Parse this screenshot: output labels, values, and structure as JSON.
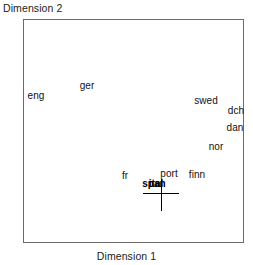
{
  "chart_data": {
    "type": "scatter",
    "title": "",
    "xlabel": "Dimension 1",
    "ylabel": "Dimension 2",
    "grid": false,
    "legend": "none",
    "axis_ticks": [],
    "xlim": [
      0,
      1
    ],
    "ylim": [
      0,
      1
    ],
    "labels_as_markers": true,
    "points": [
      {
        "label": "eng",
        "x_px": 35,
        "y_px": 95
      },
      {
        "label": "ger",
        "x_px": 86,
        "y_px": 85
      },
      {
        "label": "swed",
        "x_px": 205,
        "y_px": 100
      },
      {
        "label": "dch",
        "x_px": 235,
        "y_px": 110
      },
      {
        "label": "dan",
        "x_px": 234,
        "y_px": 127
      },
      {
        "label": "nor",
        "x_px": 215,
        "y_px": 146
      },
      {
        "label": "fr",
        "x_px": 124,
        "y_px": 175
      },
      {
        "label": "port",
        "x_px": 168,
        "y_px": 173
      },
      {
        "label": "finn",
        "x_px": 196,
        "y_px": 174
      },
      {
        "label": "ital",
        "x_px": 155,
        "y_px": 183
      },
      {
        "label": "span",
        "x_px": 153,
        "y_px": 183
      }
    ],
    "marker": {
      "name": "crosshair",
      "x_px": 160,
      "y_px": 192
    }
  },
  "figure": {
    "frame": {
      "left_px": 23,
      "top_px": 19,
      "width_px": 221,
      "height_px": 224
    }
  }
}
